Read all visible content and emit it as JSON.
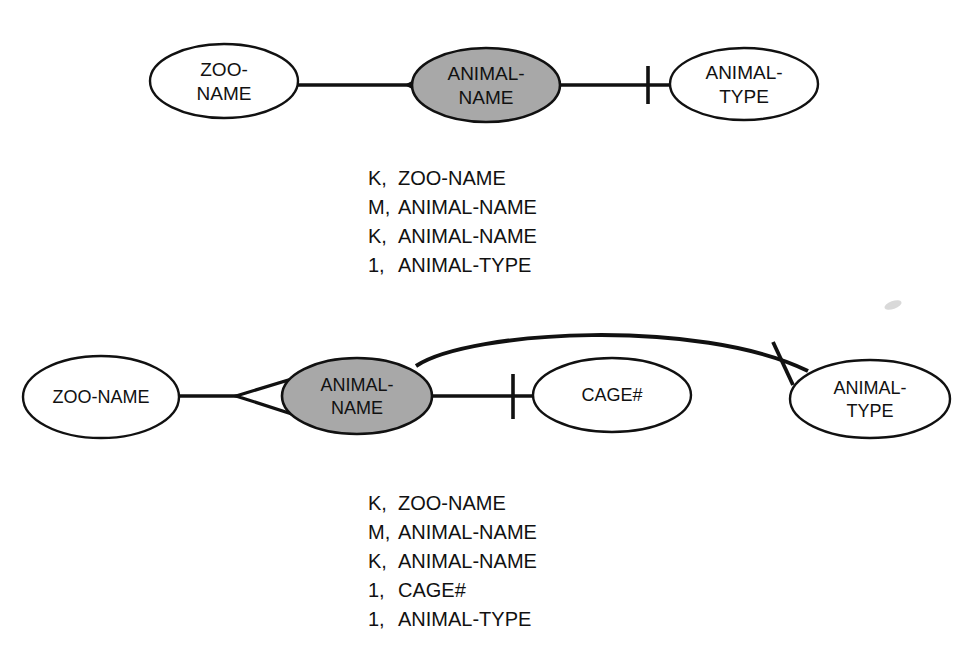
{
  "page": {
    "background_color": "#ffffff",
    "line_color": "#111111",
    "shaded_entity_fill": "#a8a8a8",
    "plain_entity_fill": "#ffffff"
  },
  "diagram_top": {
    "name": "zoo-animal-type-er-diagram",
    "entities": [
      {
        "id": "zoo-name",
        "label_lines": [
          "ZOO-",
          "NAME"
        ],
        "shaded": false,
        "cx": 224,
        "cy": 81,
        "rx": 74,
        "ry": 37
      },
      {
        "id": "animal-name",
        "label_lines": [
          "ANIMAL-",
          "NAME"
        ],
        "shaded": true,
        "cx": 486,
        "cy": 85,
        "rx": 74,
        "ry": 37
      },
      {
        "id": "animal-type",
        "label_lines": [
          "ANIMAL-",
          "TYPE"
        ],
        "shaded": false,
        "cx": 744,
        "cy": 84,
        "rx": 74,
        "ry": 36
      }
    ],
    "relationships": [
      {
        "id": "zoo-to-animal-name",
        "from": "zoo-name",
        "to": "animal-name",
        "to_cardinality": "many",
        "marker": "crow-foot"
      },
      {
        "id": "animal-name-to-animal-type",
        "from": "animal-name",
        "to": "animal-type",
        "to_cardinality": "one",
        "marker": "tick"
      }
    ],
    "attribute_list": [
      {
        "key": "K",
        "name": "ZOO-NAME"
      },
      {
        "key": "M",
        "name": "ANIMAL-NAME"
      },
      {
        "key": "K",
        "name": "ANIMAL-NAME"
      },
      {
        "key": "1",
        "name": "ANIMAL-TYPE"
      }
    ]
  },
  "diagram_bottom": {
    "name": "zoo-animal-cage-type-er-diagram",
    "entities": [
      {
        "id": "zoo-name",
        "label_lines": [
          "ZOO-NAME"
        ],
        "shaded": false,
        "cx": 101,
        "cy": 397,
        "rx": 78,
        "ry": 41
      },
      {
        "id": "animal-name",
        "label_lines": [
          "ANIMAL-",
          "NAME"
        ],
        "shaded": true,
        "cx": 357,
        "cy": 396,
        "rx": 75,
        "ry": 38
      },
      {
        "id": "cage-number",
        "label_lines": [
          "CAGE#"
        ],
        "shaded": false,
        "cx": 612,
        "cy": 395,
        "rx": 79,
        "ry": 37
      },
      {
        "id": "animal-type",
        "label_lines": [
          "ANIMAL-",
          "TYPE"
        ],
        "shaded": false,
        "cx": 870,
        "cy": 399,
        "rx": 80,
        "ry": 39
      }
    ],
    "relationships": [
      {
        "id": "zoo-to-animal-name",
        "from": "zoo-name",
        "to": "animal-name",
        "to_cardinality": "many",
        "marker": "crow-foot"
      },
      {
        "id": "animal-name-to-cage",
        "from": "animal-name",
        "to": "cage-number",
        "to_cardinality": "one",
        "marker": "tick"
      },
      {
        "id": "animal-name-to-animal-type",
        "from": "animal-name",
        "to": "animal-type",
        "to_cardinality": "one",
        "marker": "tick",
        "routing": "curved-arc-over-cage"
      }
    ],
    "attribute_list": [
      {
        "key": "K",
        "name": "ZOO-NAME"
      },
      {
        "key": "M",
        "name": "ANIMAL-NAME"
      },
      {
        "key": "K",
        "name": "ANIMAL-NAME"
      },
      {
        "key": "1",
        "name": "CAGE#"
      },
      {
        "key": "1",
        "name": "ANIMAL-TYPE"
      }
    ]
  }
}
